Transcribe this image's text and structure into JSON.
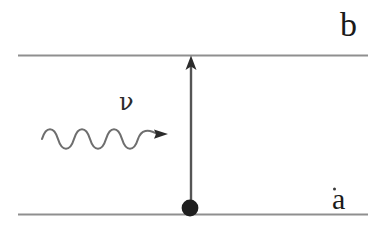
{
  "figure": {
    "kind": "energy-level-absorption-diagram",
    "background_color": "#ffffff",
    "line_color": "#8a8a8a",
    "ink_color": "#2b2b2b"
  },
  "levels": {
    "upper": {
      "label": "b",
      "line_y": 55,
      "line_x_start": 18,
      "line_x_end": 368
    },
    "lower": {
      "label": "a",
      "line_y": 214,
      "line_x_start": 18,
      "line_x_end": 368
    }
  },
  "transition": {
    "arrow_label": "",
    "direction": "up",
    "x": 191,
    "y_tail": 207,
    "y_head": 56
  },
  "electron": {
    "label": "",
    "x": 190,
    "y": 208,
    "radius": 8
  },
  "photon": {
    "label": "ν",
    "label_x": 119,
    "label_y": 90,
    "wave_x_start": 42,
    "wave_x_end": 160,
    "wave_y_center": 139,
    "wave_amplitude": 11,
    "wave_cycles": 3,
    "direction": "right"
  }
}
